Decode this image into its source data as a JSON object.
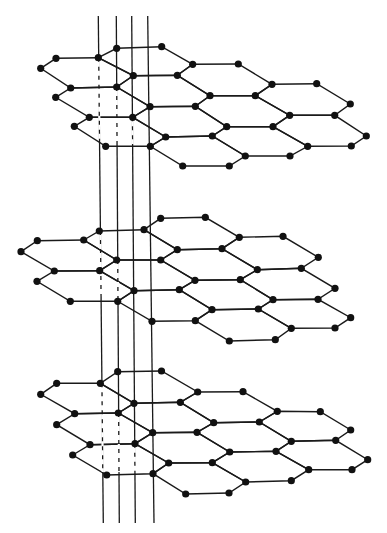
{
  "figure": {
    "description": "Three stacked hexagonal lattice layers pierced by four vertical lines",
    "colors": {
      "line": "#1a1a1a",
      "node": "#111111",
      "background": "#ffffff"
    },
    "node_radius": 3.6
  },
  "vertical_lines": [
    {
      "x1": 98.3,
      "y1": 16,
      "x2": 103.3,
      "y2": 523,
      "dashed_segments": [
        [
          57.7,
          141
        ],
        [
          231,
          298
        ],
        [
          383.3,
          472
        ]
      ]
    },
    {
      "x1": 116.3,
      "y1": 16,
      "x2": 119.3,
      "y2": 523,
      "dashed_segments": [
        [
          87,
          144
        ],
        [
          260,
          299
        ],
        [
          413,
          472
        ]
      ]
    },
    {
      "x1": 131.7,
      "y1": 16,
      "x2": 135.3,
      "y2": 523,
      "dashed_segments": [
        [
          117.3,
          144
        ],
        [
          443.7,
          472
        ]
      ]
    },
    {
      "x1": 147.7,
      "y1": 16,
      "x2": 154.0,
      "y2": 523,
      "dashed_segments": []
    }
  ],
  "layers": [
    {
      "name": "top-layer",
      "hexagons": [
        [
          [
            40.7,
            68.3
          ],
          [
            56,
            58.3
          ],
          [
            98.3,
            57.7
          ],
          [
            133.3,
            75.7
          ],
          [
            116.7,
            87
          ],
          [
            70.7,
            88
          ]
        ],
        [
          [
            98.3,
            57.7
          ],
          [
            116.7,
            48.3
          ],
          [
            161.7,
            46.7
          ],
          [
            192.7,
            64.3
          ],
          [
            177.3,
            75.3
          ],
          [
            133.3,
            75.7
          ]
        ],
        [
          [
            177.3,
            75.3
          ],
          [
            192.7,
            64.3
          ],
          [
            238.3,
            64
          ],
          [
            272,
            84.3
          ],
          [
            255.3,
            95.7
          ],
          [
            210,
            95.7
          ]
        ],
        [
          [
            55.7,
            97.3
          ],
          [
            70.7,
            88
          ],
          [
            116.7,
            87
          ],
          [
            150,
            106.7
          ],
          [
            132.7,
            117.3
          ],
          [
            89.3,
            117.3
          ]
        ],
        [
          [
            116.7,
            87
          ],
          [
            133.3,
            75.7
          ],
          [
            177.3,
            75.3
          ],
          [
            210,
            95.7
          ],
          [
            195.3,
            106.3
          ],
          [
            150,
            106.7
          ]
        ],
        [
          [
            195.3,
            106.3
          ],
          [
            210,
            95.7
          ],
          [
            255.3,
            95.7
          ],
          [
            289.7,
            115.3
          ],
          [
            273,
            126.7
          ],
          [
            226.7,
            126.7
          ]
        ],
        [
          [
            255.3,
            95.7
          ],
          [
            272,
            84.3
          ],
          [
            316.7,
            83.7
          ],
          [
            350.3,
            104
          ],
          [
            334.7,
            115.3
          ],
          [
            289.7,
            115.3
          ]
        ],
        [
          [
            74.3,
            126.3
          ],
          [
            89.3,
            117.3
          ],
          [
            132.7,
            117.3
          ],
          [
            165.7,
            137
          ],
          [
            150.3,
            146.3
          ],
          [
            105.7,
            146.3
          ]
        ],
        [
          [
            132.7,
            117.3
          ],
          [
            150,
            106.7
          ],
          [
            195.3,
            106.3
          ],
          [
            226.7,
            126.7
          ],
          [
            212.3,
            136
          ],
          [
            165.7,
            137
          ]
        ],
        [
          [
            212.3,
            136
          ],
          [
            226.7,
            126.7
          ],
          [
            273,
            126.7
          ],
          [
            307.7,
            146.3
          ],
          [
            290,
            156
          ],
          [
            245.3,
            156
          ]
        ],
        [
          [
            273,
            126.7
          ],
          [
            289.7,
            115.3
          ],
          [
            334.7,
            115.3
          ],
          [
            366.3,
            136
          ],
          [
            351.3,
            146
          ],
          [
            307.7,
            146.3
          ]
        ],
        [
          [
            150.3,
            146.3
          ],
          [
            165.7,
            137
          ],
          [
            212.3,
            136
          ],
          [
            245.3,
            156
          ],
          [
            229.3,
            166
          ],
          [
            182.7,
            166
          ]
        ]
      ]
    },
    {
      "name": "middle-layer",
      "hexagons": [
        [
          [
            21,
            251.7
          ],
          [
            37.3,
            240.7
          ],
          [
            83.7,
            240
          ],
          [
            116.7,
            260
          ],
          [
            99.7,
            270.7
          ],
          [
            54.3,
            271
          ]
        ],
        [
          [
            83.7,
            240
          ],
          [
            99.3,
            231
          ],
          [
            144,
            229.7
          ],
          [
            177.3,
            249.7
          ],
          [
            160.7,
            260
          ],
          [
            116.7,
            260
          ]
        ],
        [
          [
            144,
            229.7
          ],
          [
            160.7,
            218.3
          ],
          [
            205.3,
            217.3
          ],
          [
            239.3,
            237.3
          ],
          [
            222,
            248.7
          ],
          [
            177.3,
            249.7
          ]
        ],
        [
          [
            37,
            281.3
          ],
          [
            54.3,
            271
          ],
          [
            99.7,
            270.7
          ],
          [
            134,
            290.7
          ],
          [
            117.7,
            301.3
          ],
          [
            70.3,
            301.3
          ]
        ],
        [
          [
            99.7,
            270.7
          ],
          [
            116.7,
            260
          ],
          [
            160.7,
            260
          ],
          [
            195,
            280.3
          ],
          [
            179.3,
            289.7
          ],
          [
            134,
            290.7
          ]
        ],
        [
          [
            160.7,
            260
          ],
          [
            177.3,
            249.7
          ],
          [
            222,
            248.7
          ],
          [
            257.3,
            269.7
          ],
          [
            240.3,
            279.7
          ],
          [
            195,
            280.3
          ]
        ],
        [
          [
            222,
            248.7
          ],
          [
            239.3,
            237.3
          ],
          [
            283,
            236.3
          ],
          [
            318.3,
            257.3
          ],
          [
            301.3,
            268.3
          ],
          [
            257.3,
            269.7
          ]
        ],
        [
          [
            117.7,
            301.3
          ],
          [
            134,
            290.7
          ],
          [
            179.3,
            289.7
          ],
          [
            212,
            309.7
          ],
          [
            195.3,
            320.7
          ],
          [
            152,
            321.3
          ]
        ],
        [
          [
            179.3,
            289.7
          ],
          [
            195,
            280.3
          ],
          [
            240.3,
            279.7
          ],
          [
            273,
            299.7
          ],
          [
            258.3,
            309
          ],
          [
            212,
            309.7
          ]
        ],
        [
          [
            240.3,
            279.7
          ],
          [
            257.3,
            269.7
          ],
          [
            301.3,
            268.3
          ],
          [
            335,
            288.3
          ],
          [
            318,
            299.3
          ],
          [
            273,
            299.7
          ]
        ],
        [
          [
            195.3,
            320.7
          ],
          [
            212,
            309.7
          ],
          [
            258.3,
            309
          ],
          [
            291.3,
            328.3
          ],
          [
            275.3,
            339.7
          ],
          [
            229.3,
            341
          ]
        ],
        [
          [
            258.3,
            309
          ],
          [
            273,
            299.7
          ],
          [
            318,
            299.3
          ],
          [
            350.7,
            317.7
          ],
          [
            335,
            328
          ],
          [
            291.3,
            328.3
          ]
        ]
      ]
    },
    {
      "name": "bottom-layer",
      "hexagons": [
        [
          [
            40.7,
            394.3
          ],
          [
            56.7,
            383.3
          ],
          [
            100.3,
            383.3
          ],
          [
            134,
            403.3
          ],
          [
            118.3,
            413
          ],
          [
            74.7,
            413.7
          ]
        ],
        [
          [
            100.3,
            383.3
          ],
          [
            117.7,
            371.7
          ],
          [
            161.5,
            371
          ],
          [
            197.7,
            392
          ],
          [
            180.3,
            402.3
          ],
          [
            134,
            403.3
          ]
        ],
        [
          [
            180.3,
            402.3
          ],
          [
            197.7,
            392
          ],
          [
            243,
            391.7
          ],
          [
            277.3,
            411.3
          ],
          [
            259.3,
            422
          ],
          [
            213.7,
            422.7
          ]
        ],
        [
          [
            56.7,
            424.7
          ],
          [
            74.7,
            413.7
          ],
          [
            118.3,
            413
          ],
          [
            152.7,
            432.7
          ],
          [
            135,
            443.7
          ],
          [
            90,
            444.7
          ]
        ],
        [
          [
            118.3,
            413
          ],
          [
            134,
            403.3
          ],
          [
            180.3,
            402.3
          ],
          [
            213.7,
            422.7
          ],
          [
            197,
            432.3
          ],
          [
            152.7,
            432.7
          ]
        ],
        [
          [
            197,
            432.3
          ],
          [
            213.7,
            422.7
          ],
          [
            259.3,
            422
          ],
          [
            291.3,
            441.3
          ],
          [
            276,
            451.3
          ],
          [
            229.7,
            452
          ]
        ],
        [
          [
            259.3,
            422
          ],
          [
            277.3,
            411.3
          ],
          [
            320.3,
            411.7
          ],
          [
            350.7,
            430
          ],
          [
            335.7,
            440.3
          ],
          [
            291.3,
            441.3
          ]
        ],
        [
          [
            72.7,
            455
          ],
          [
            90,
            444.7
          ],
          [
            135,
            443.7
          ],
          [
            168.7,
            463
          ],
          [
            153,
            473.7
          ],
          [
            106.7,
            475
          ]
        ],
        [
          [
            135,
            443.7
          ],
          [
            152.7,
            432.7
          ],
          [
            197,
            432.3
          ],
          [
            229.7,
            452
          ],
          [
            212.3,
            462.7
          ],
          [
            168.7,
            463
          ]
        ],
        [
          [
            212.3,
            462.7
          ],
          [
            229.7,
            452
          ],
          [
            276,
            451.3
          ],
          [
            308.7,
            469.7
          ],
          [
            291.3,
            480.7
          ],
          [
            245.7,
            482
          ]
        ],
        [
          [
            276,
            451.3
          ],
          [
            291.3,
            441.3
          ],
          [
            335.7,
            440.3
          ],
          [
            367.7,
            459.7
          ],
          [
            352,
            469.7
          ],
          [
            308.7,
            469.7
          ]
        ],
        [
          [
            153,
            473.7
          ],
          [
            168.7,
            463
          ],
          [
            212.3,
            462.7
          ],
          [
            245.7,
            482
          ],
          [
            229,
            493
          ],
          [
            185.7,
            494
          ]
        ]
      ]
    }
  ]
}
